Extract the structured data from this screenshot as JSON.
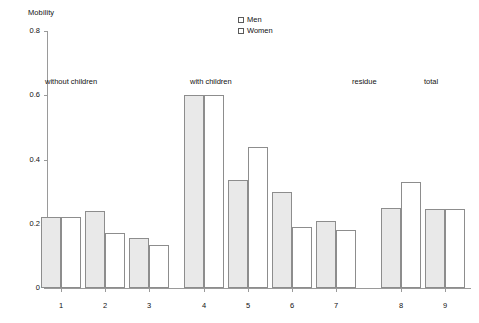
{
  "chart_data": {
    "type": "bar",
    "title": "",
    "ylabel": "Mobility",
    "xlabel": "",
    "ylim": [
      0,
      0.8
    ],
    "yticks": [
      "0",
      "0.2",
      "0.4",
      "0.6",
      "0.8"
    ],
    "ytick_values": [
      0,
      0.2,
      0.4,
      0.6,
      0.8
    ],
    "grid": false,
    "legend_position": "top-center",
    "categories": [
      "1",
      "2",
      "3",
      "4",
      "5",
      "6",
      "7",
      "8",
      "9"
    ],
    "series": [
      {
        "name": "Men",
        "values": [
          0.22,
          0.24,
          0.155,
          0.6,
          0.335,
          0.3,
          0.21,
          0.25,
          0.245
        ]
      },
      {
        "name": "Women",
        "values": [
          0.22,
          0.17,
          0.135,
          0.6,
          0.44,
          0.19,
          0.18,
          0.33,
          0.245
        ]
      }
    ],
    "annotations": [
      {
        "text": "without children",
        "categories": [
          "1",
          "2",
          "3"
        ]
      },
      {
        "text": "with children",
        "categories": [
          "4",
          "5",
          "6",
          "7"
        ]
      },
      {
        "text": "residue",
        "categories": [
          "8"
        ]
      },
      {
        "text": "total",
        "categories": [
          "9"
        ]
      }
    ],
    "colors": {
      "men_fill": "#e9e9e9",
      "women_fill": "#ffffff",
      "bar_border": "#8d8d8d",
      "axis": "#9a9a9a",
      "text": "#111111"
    }
  },
  "legend": {
    "items": [
      {
        "label": "Men"
      },
      {
        "label": "Women"
      }
    ]
  }
}
